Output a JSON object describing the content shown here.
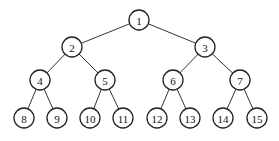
{
  "tree": {
    "type": "complete-binary-tree",
    "nodes": [
      {
        "id": 1,
        "label": "1",
        "x": 139,
        "y": 20
      },
      {
        "id": 2,
        "label": "2",
        "x": 72,
        "y": 47
      },
      {
        "id": 3,
        "label": "3",
        "x": 205,
        "y": 47
      },
      {
        "id": 4,
        "label": "4",
        "x": 40,
        "y": 80
      },
      {
        "id": 5,
        "label": "5",
        "x": 105,
        "y": 80
      },
      {
        "id": 6,
        "label": "6",
        "x": 173,
        "y": 80
      },
      {
        "id": 7,
        "label": "7",
        "x": 240,
        "y": 80
      },
      {
        "id": 8,
        "label": "8",
        "x": 24,
        "y": 118
      },
      {
        "id": 9,
        "label": "9",
        "x": 57,
        "y": 118
      },
      {
        "id": 10,
        "label": "10",
        "x": 90,
        "y": 118
      },
      {
        "id": 11,
        "label": "11",
        "x": 123,
        "y": 118
      },
      {
        "id": 12,
        "label": "12",
        "x": 157,
        "y": 118
      },
      {
        "id": 13,
        "label": "13",
        "x": 190,
        "y": 118
      },
      {
        "id": 14,
        "label": "14",
        "x": 223,
        "y": 118
      },
      {
        "id": 15,
        "label": "15",
        "x": 257,
        "y": 118
      }
    ],
    "edges": [
      [
        1,
        2
      ],
      [
        1,
        3
      ],
      [
        2,
        4
      ],
      [
        2,
        5
      ],
      [
        3,
        6
      ],
      [
        3,
        7
      ],
      [
        4,
        8
      ],
      [
        4,
        9
      ],
      [
        5,
        10
      ],
      [
        5,
        11
      ],
      [
        6,
        12
      ],
      [
        6,
        13
      ],
      [
        7,
        14
      ],
      [
        7,
        15
      ]
    ],
    "node_radius": 10
  }
}
